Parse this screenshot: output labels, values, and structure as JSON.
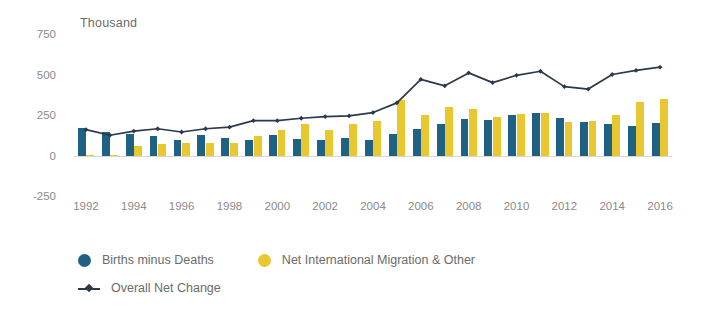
{
  "axis_unit_label": "Thousand",
  "colors": {
    "births_minus_deaths": "#1f6183",
    "net_migration": "#e9c731",
    "overall_net_change": "#2b3a4a",
    "tick_text": "#8a8a8a",
    "background": "#ffffff"
  },
  "legend": {
    "items": [
      {
        "label": "Births minus Deaths",
        "marker": "circle-blue"
      },
      {
        "label": "Net International Migration & Other",
        "marker": "circle-yellow"
      },
      {
        "label": "Overall Net Change",
        "marker": "line-with-square-marker"
      }
    ]
  },
  "chart_data": {
    "type": "bar",
    "title": "",
    "subtitle": "",
    "xlabel": "",
    "ylabel": "Thousand",
    "ylim": [
      -250,
      750
    ],
    "yticks": [
      -250,
      0,
      250,
      500,
      750
    ],
    "ytick_labels": [
      "-250",
      "0",
      "250",
      "500",
      "750"
    ],
    "grid": false,
    "legend_position": "bottom-left",
    "x": [
      1992,
      1993,
      1994,
      1995,
      1996,
      1997,
      1998,
      1999,
      2000,
      2001,
      2002,
      2003,
      2004,
      2005,
      2006,
      2007,
      2008,
      2009,
      2010,
      2011,
      2012,
      2013,
      2014,
      2015,
      2016
    ],
    "xtick_labels": [
      "1992",
      "1994",
      "1996",
      "1998",
      "2000",
      "2002",
      "2004",
      "2006",
      "2008",
      "2010",
      "2012",
      "2014",
      "2016"
    ],
    "xticks": [
      1992,
      1994,
      1996,
      1998,
      2000,
      2002,
      2004,
      2006,
      2008,
      2010,
      2012,
      2014,
      2016
    ],
    "series": [
      {
        "name": "Births minus Deaths",
        "type": "bar",
        "color": "#1f6183",
        "values": [
          170,
          145,
          130,
          120,
          95,
          125,
          110,
          95,
          125,
          100,
          95,
          110,
          95,
          130,
          165,
          195,
          225,
          220,
          250,
          260,
          230,
          205,
          195,
          180,
          200
        ]
      },
      {
        "name": "Net International Migration & Other",
        "type": "bar",
        "color": "#e9c731",
        "values": [
          5,
          5,
          60,
          70,
          80,
          75,
          80,
          120,
          155,
          195,
          160,
          195,
          215,
          340,
          250,
          300,
          285,
          235,
          255,
          265,
          205,
          215,
          250,
          330,
          350
        ]
      },
      {
        "name": "Overall Net Change",
        "type": "line",
        "color": "#2b3a4a",
        "values": [
          160,
          125,
          150,
          165,
          145,
          165,
          175,
          215,
          215,
          230,
          240,
          245,
          265,
          325,
          470,
          430,
          510,
          450,
          495,
          520,
          425,
          410,
          500,
          525,
          545
        ]
      }
    ]
  }
}
